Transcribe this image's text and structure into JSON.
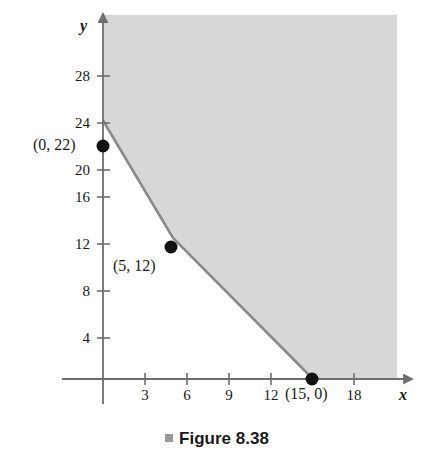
{
  "figure": {
    "caption": "Figure 8.38",
    "caption_bullet": "square-bullet",
    "background_color": "#ffffff"
  },
  "chart_data": {
    "type": "line",
    "title": "Figure 8.38",
    "subtitle": "",
    "xlabel": "x",
    "ylabel": "y",
    "xlim": [
      -1,
      21
    ],
    "ylim": [
      -2,
      31
    ],
    "grid": false,
    "legend": "none",
    "x_ticks": [
      3,
      6,
      9,
      12,
      15,
      18
    ],
    "x_tick_labels": [
      "3",
      "6",
      "9",
      "12",
      "",
      "18"
    ],
    "y_ticks": [
      4,
      8,
      12,
      16,
      20,
      24,
      28
    ],
    "y_tick_labels": [
      "4",
      "8",
      "12",
      "16",
      "20",
      "24",
      "28"
    ],
    "series": [
      {
        "name": "feasible-region-boundary",
        "type": "piecewise-line",
        "color": "#808080",
        "x": [
          0,
          5,
          15
        ],
        "y": [
          22,
          12,
          0
        ]
      }
    ],
    "points": [
      {
        "name": "corner-point-1",
        "x": 0,
        "y": 22,
        "label": "(0, 22)",
        "label_position": "left"
      },
      {
        "name": "corner-point-2",
        "x": 5,
        "y": 12,
        "label": "(5, 12)",
        "label_position": "below-left"
      },
      {
        "name": "corner-point-3",
        "x": 15,
        "y": 0,
        "label": "(15, 0)",
        "label_position": "below"
      }
    ],
    "shaded_region": {
      "name": "feasible-region",
      "description": "Region above and to the right of the piecewise boundary",
      "fill_color": "#d7d7d7",
      "vertices": [
        [
          0,
          22
        ],
        [
          5,
          12
        ],
        [
          15,
          0
        ],
        [
          21,
          0
        ],
        [
          21,
          31
        ],
        [
          0,
          31
        ]
      ]
    },
    "annotations": [
      {
        "text": "(0, 22)",
        "x": 0,
        "y": 22
      },
      {
        "text": "(5, 12)",
        "x": 5,
        "y": 12
      },
      {
        "text": "(15, 0)",
        "x": 15,
        "y": 0
      }
    ],
    "axis_arrow_x": true,
    "axis_arrow_y": true
  },
  "axes": {
    "x_label": "x",
    "y_label": "y",
    "axis_color": "#6e6e6e",
    "tick_color": "#6e6e6e"
  }
}
